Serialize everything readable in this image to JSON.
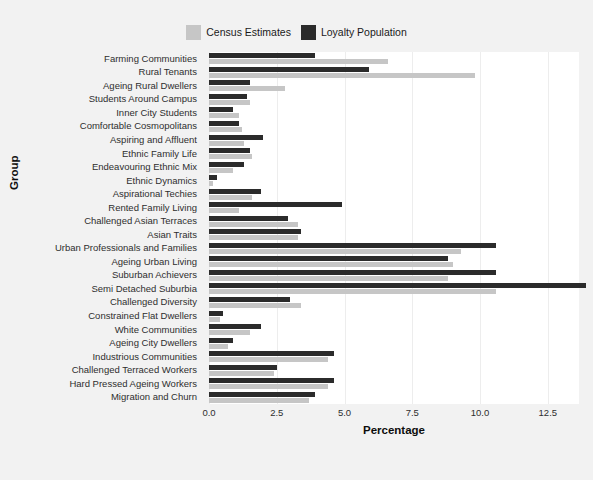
{
  "chart_data": {
    "type": "bar",
    "orientation": "horizontal",
    "title": "",
    "xlabel": "Percentage",
    "ylabel": "Group",
    "xlim": [
      0,
      13.65
    ],
    "xticks": [
      0.0,
      2.5,
      5.0,
      7.5,
      10.0,
      12.5
    ],
    "xtick_labels": [
      "0.0",
      "2.5",
      "5.0",
      "7.5",
      "10.0",
      "12.5"
    ],
    "grid": "vertical-only",
    "legend_position": "top-center",
    "categories": [
      "Farming Communities",
      "Rural Tenants",
      "Ageing Rural Dwellers",
      "Students Around Campus",
      "Inner City Students",
      "Comfortable Cosmopolitans",
      "Aspiring and Affluent",
      "Ethnic Family Life",
      "Endeavouring Ethnic Mix",
      "Ethnic Dynamics",
      "Aspirational Techies",
      "Rented Family Living",
      "Challenged Asian Terraces",
      "Asian Traits",
      "Urban Professionals and Families",
      "Ageing Urban Living",
      "Suburban Achievers",
      "Semi Detached Suburbia",
      "Challenged Diversity",
      "Constrained Flat Dwellers",
      "White Communities",
      "Ageing City Dwellers",
      "Industrious Communities",
      "Challenged Terraced Workers",
      "Hard Pressed Ageing Workers",
      "Migration and Churn"
    ],
    "series": [
      {
        "name": "Loyalty Population",
        "color": "#2b2b2b",
        "values": [
          3.9,
          5.9,
          1.5,
          1.4,
          0.9,
          1.1,
          2.0,
          1.5,
          1.3,
          0.3,
          1.9,
          4.9,
          2.9,
          3.4,
          10.6,
          8.8,
          10.6,
          13.9,
          3.0,
          0.5,
          1.9,
          0.9,
          4.6,
          2.5,
          4.6,
          3.9
        ]
      },
      {
        "name": "Census Estimates",
        "color": "#c6c6c6",
        "values": [
          6.6,
          9.8,
          2.8,
          1.5,
          1.1,
          1.2,
          1.3,
          1.6,
          0.9,
          0.15,
          1.6,
          1.1,
          3.3,
          3.3,
          9.3,
          9.0,
          8.8,
          10.6,
          3.4,
          0.4,
          1.5,
          0.7,
          4.4,
          2.4,
          4.4,
          3.7
        ]
      }
    ]
  },
  "legend": {
    "items": [
      {
        "label": "Census Estimates",
        "color": "#c6c6c6"
      },
      {
        "label": "Loyalty Population",
        "color": "#2b2b2b"
      }
    ]
  }
}
